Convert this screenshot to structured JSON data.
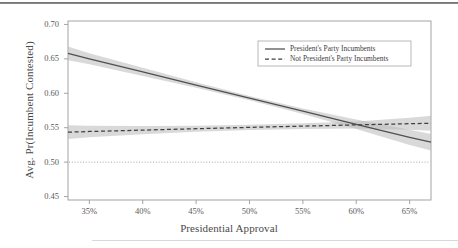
{
  "figure": {
    "background": "#ffffff",
    "frame_color": "#9a9a9a",
    "top_rule_color": "#6d6d6d",
    "bottom_rule_color": "#d8d8d8"
  },
  "chart_data": {
    "type": "line",
    "title": "",
    "xlabel": "Presidential Approval",
    "ylabel": "Avg. Pr(Incumbent Contested)",
    "xlim": [
      33.0,
      67.0
    ],
    "ylim": [
      0.445,
      0.705
    ],
    "xticks": [
      35,
      40,
      45,
      50,
      55,
      60,
      65
    ],
    "xticklabels": [
      "35%",
      "40%",
      "45%",
      "50%",
      "55%",
      "60%",
      "65%"
    ],
    "yticks": [
      0.45,
      0.5,
      0.55,
      0.6,
      0.65,
      0.7
    ],
    "yticklabels": [
      "0.45",
      "0.50",
      "0.55",
      "0.60",
      "0.65",
      "0.70"
    ],
    "grid": false,
    "legend_position": "upper right",
    "reference_line": {
      "orientation": "horizontal",
      "value": 0.5,
      "style": "dotted",
      "color": "#9b9b9b"
    },
    "x": [
      33.0,
      35.0,
      40.0,
      45.0,
      50.0,
      55.0,
      60.0,
      65.0,
      67.0
    ],
    "series": [
      {
        "name": "President's Party Incumbents",
        "style": "solid",
        "color": "#4f4f4f",
        "band_color": "#b9b9b9",
        "values": [
          0.658,
          0.65,
          0.631,
          0.612,
          0.593,
          0.574,
          0.555,
          0.536,
          0.529
        ],
        "ci_lower": [
          0.648,
          0.642,
          0.625,
          0.608,
          0.59,
          0.57,
          0.548,
          0.525,
          0.517
        ],
        "ci_upper": [
          0.668,
          0.658,
          0.637,
          0.616,
          0.596,
          0.578,
          0.562,
          0.547,
          0.541
        ]
      },
      {
        "name": "Not President's Party Incumbents",
        "style": "dashed",
        "color": "#3f3f3f",
        "band_color": "#b9b9b9",
        "values": [
          0.5435,
          0.5445,
          0.5465,
          0.5485,
          0.5505,
          0.5523,
          0.5541,
          0.5558,
          0.5565
        ],
        "ci_lower": [
          0.5335,
          0.536,
          0.5405,
          0.544,
          0.5468,
          0.5483,
          0.549,
          0.547,
          0.5455
        ],
        "ci_upper": [
          0.5535,
          0.553,
          0.5525,
          0.553,
          0.5542,
          0.5563,
          0.5592,
          0.5646,
          0.5675
        ]
      }
    ],
    "legend_entries": [
      {
        "label": "President's Party Incumbents",
        "style": "solid"
      },
      {
        "label": "Not President's Party Incumbents",
        "style": "dashed"
      }
    ]
  }
}
